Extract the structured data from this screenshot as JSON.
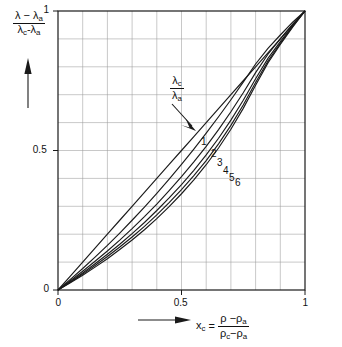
{
  "figure": {
    "background_color": "#ffffff",
    "ink_color": "#1a1a1a",
    "grid_color": "#9a9a9a"
  },
  "axes": {
    "x": {
      "label_variable": "x",
      "label_variable_sub": "c",
      "label_equals": "=",
      "numerator": "ρ −ρ",
      "numerator_sub": "a",
      "denominator_first": "ρ",
      "denominator_first_sub": "c",
      "denominator_rest": "−ρ",
      "denominator_rest_sub": "a",
      "ticks": [
        "0",
        "0.5",
        "1"
      ],
      "tick_values": [
        0,
        0.5,
        1
      ],
      "range": [
        0,
        1
      ],
      "arrow": "left-to-right-arrow"
    },
    "y": {
      "numerator": "λ − λ",
      "numerator_sub": "a",
      "denominator_first": "λ",
      "denominator_first_sub": "c",
      "denominator_rest": "-λ",
      "denominator_rest_sub": "a",
      "ticks": [
        "0",
        "0.5",
        "1"
      ],
      "tick_values": [
        0,
        0.5,
        1
      ],
      "range": [
        0,
        1
      ],
      "arrow": "upward-arrow"
    },
    "grid": {
      "minor_divisions": 10,
      "visible": true
    }
  },
  "annotation": {
    "ratio_numerator": "λ",
    "ratio_numerator_sub": "c",
    "ratio_denominator": "λ",
    "ratio_denominator_sub": "a",
    "arrow": "pointer-arrow-to-curve-1"
  },
  "curve_labels": [
    {
      "text": "1",
      "x": 201,
      "y": 136
    },
    {
      "text": "2",
      "x": 211,
      "y": 148
    },
    {
      "text": "3",
      "x": 217,
      "y": 157
    },
    {
      "text": "4",
      "x": 223,
      "y": 165
    },
    {
      "text": "5",
      "x": 229,
      "y": 172
    },
    {
      "text": "6",
      "x": 235,
      "y": 177
    }
  ],
  "chart_data": {
    "type": "line",
    "title": "",
    "xlabel": "x_c = (ρ - ρ_a)/(ρ_c - ρ_a)",
    "ylabel": "(λ - λ_a)/(λ_c - λ_a)",
    "xlim": [
      0,
      1
    ],
    "ylim": [
      0,
      1
    ],
    "grid": true,
    "legend": "inline-curve-numbers",
    "x": [
      0,
      0.05,
      0.1,
      0.15,
      0.2,
      0.25,
      0.3,
      0.35,
      0.4,
      0.45,
      0.5,
      0.55,
      0.6,
      0.65,
      0.7,
      0.75,
      0.8,
      0.85,
      0.9,
      0.95,
      1
    ],
    "series": [
      {
        "name": "1",
        "ratio_lambda_c_over_lambda_a": 1,
        "values": [
          0,
          0.05,
          0.1,
          0.15,
          0.2,
          0.25,
          0.3,
          0.35,
          0.4,
          0.45,
          0.5,
          0.55,
          0.6,
          0.65,
          0.7,
          0.75,
          0.8,
          0.85,
          0.9,
          0.95,
          1
        ]
      },
      {
        "name": "2",
        "ratio_lambda_c_over_lambda_a": 2,
        "values": [
          0,
          0.038,
          0.077,
          0.118,
          0.16,
          0.204,
          0.25,
          0.297,
          0.346,
          0.397,
          0.45,
          0.505,
          0.562,
          0.621,
          0.682,
          0.745,
          0.81,
          0.866,
          0.914,
          0.96,
          1
        ]
      },
      {
        "name": "3",
        "ratio_lambda_c_over_lambda_a": 3,
        "values": [
          0,
          0.033,
          0.067,
          0.103,
          0.14,
          0.179,
          0.22,
          0.263,
          0.308,
          0.356,
          0.406,
          0.459,
          0.515,
          0.575,
          0.639,
          0.707,
          0.779,
          0.845,
          0.9,
          0.953,
          1
        ]
      },
      {
        "name": "4",
        "ratio_lambda_c_over_lambda_a": 4,
        "values": [
          0,
          0.03,
          0.061,
          0.094,
          0.128,
          0.164,
          0.202,
          0.242,
          0.285,
          0.33,
          0.378,
          0.429,
          0.484,
          0.544,
          0.609,
          0.68,
          0.757,
          0.83,
          0.89,
          0.948,
          1
        ]
      },
      {
        "name": "5",
        "ratio_lambda_c_over_lambda_a": 5,
        "values": [
          0,
          0.028,
          0.057,
          0.088,
          0.12,
          0.154,
          0.19,
          0.228,
          0.269,
          0.313,
          0.36,
          0.41,
          0.464,
          0.524,
          0.59,
          0.663,
          0.744,
          0.821,
          0.884,
          0.945,
          1
        ]
      },
      {
        "name": "6",
        "ratio_lambda_c_over_lambda_a": 6,
        "values": [
          0,
          0.026,
          0.053,
          0.082,
          0.112,
          0.145,
          0.179,
          0.216,
          0.256,
          0.299,
          0.345,
          0.395,
          0.449,
          0.509,
          0.576,
          0.651,
          0.734,
          0.814,
          0.88,
          0.942,
          1
        ]
      }
    ]
  }
}
